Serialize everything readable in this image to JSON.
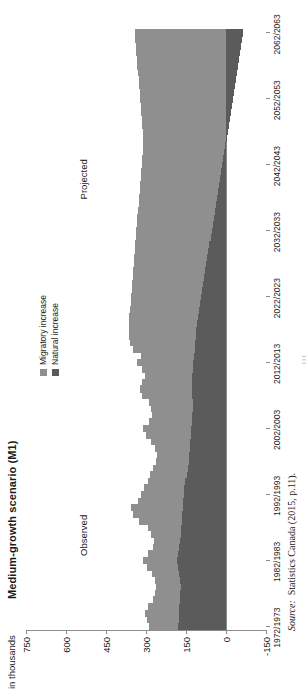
{
  "figure": {
    "title": "Medium-growth scenario (M1)",
    "axis_unit": "in thousands",
    "source_label": "Source:",
    "source_text": "Statistics Canada (2015, p.11).",
    "page_marker": "111"
  },
  "legend": {
    "position": "top-center-right",
    "items": [
      {
        "label": "Migratory increase",
        "color": "#8f8f8f",
        "key": "migratory"
      },
      {
        "label": "Natural increase",
        "color": "#5b5b5b",
        "key": "natural"
      }
    ]
  },
  "annotations": [
    {
      "name": "observed-label",
      "text": "Observed",
      "at_category": "1986/1987"
    },
    {
      "name": "projected-label",
      "text": "Projected",
      "at_category": "2040/2041"
    }
  ],
  "chart_data": {
    "type": "bar",
    "stacked": true,
    "orientation": "vertical",
    "title": "Medium-growth scenario (M1)",
    "xlabel": "",
    "ylabel": "in thousands",
    "ylim": [
      -150,
      750
    ],
    "yticks": [
      750,
      600,
      450,
      300,
      150,
      0,
      -150
    ],
    "ytick_labels": [
      "750",
      "600",
      "450",
      "300",
      "150",
      "0",
      "-150"
    ],
    "grid": false,
    "legend_position": "upper right",
    "xtick_labels": [
      "1972/1973",
      "1982/1983",
      "1992/1993",
      "2002/2003",
      "2012/2013",
      "2022/2023",
      "2032/2033",
      "2042/2043",
      "2052/2053",
      "2062/2063"
    ],
    "categories": [
      "1972/1973",
      "1973/1974",
      "1974/1975",
      "1975/1976",
      "1976/1977",
      "1977/1978",
      "1978/1979",
      "1979/1980",
      "1980/1981",
      "1981/1982",
      "1982/1983",
      "1983/1984",
      "1984/1985",
      "1985/1986",
      "1986/1987",
      "1987/1988",
      "1988/1989",
      "1989/1990",
      "1990/1991",
      "1991/1992",
      "1992/1993",
      "1993/1994",
      "1994/1995",
      "1995/1996",
      "1996/1997",
      "1997/1998",
      "1998/1999",
      "1999/2000",
      "2000/2001",
      "2001/2002",
      "2002/2003",
      "2003/2004",
      "2004/2005",
      "2005/2006",
      "2006/2007",
      "2007/2008",
      "2008/2009",
      "2009/2010",
      "2010/2011",
      "2011/2012",
      "2012/2013",
      "2013/2014",
      "2014/2015",
      "2015/2016",
      "2016/2017",
      "2017/2018",
      "2018/2019",
      "2019/2020",
      "2020/2021",
      "2021/2022",
      "2022/2023",
      "2023/2024",
      "2024/2025",
      "2025/2026",
      "2026/2027",
      "2027/2028",
      "2028/2029",
      "2029/2030",
      "2030/2031",
      "2031/2032",
      "2032/2033",
      "2033/2034",
      "2034/2035",
      "2035/2036",
      "2036/2037",
      "2037/2038",
      "2038/2039",
      "2039/2040",
      "2040/2041",
      "2041/2042",
      "2042/2043",
      "2043/2044",
      "2044/2045",
      "2045/2046",
      "2046/2047",
      "2047/2048",
      "2048/2049",
      "2049/2050",
      "2050/2051",
      "2051/2052",
      "2052/2053",
      "2053/2054",
      "2054/2055",
      "2055/2056",
      "2056/2057",
      "2057/2058",
      "2058/2059",
      "2059/2060",
      "2060/2061",
      "2061/2062",
      "2062/2063"
    ],
    "series": [
      {
        "name": "Natural increase",
        "key": "natural",
        "color": "#5b5b5b",
        "values": [
          180,
          178,
          176,
          175,
          174,
          172,
          170,
          172,
          176,
          180,
          182,
          180,
          176,
          172,
          170,
          168,
          166,
          164,
          162,
          160,
          158,
          156,
          152,
          148,
          144,
          140,
          138,
          136,
          134,
          132,
          130,
          128,
          126,
          124,
          124,
          126,
          128,
          128,
          126,
          124,
          122,
          120,
          118,
          116,
          114,
          112,
          110,
          106,
          102,
          98,
          94,
          90,
          86,
          82,
          78,
          74,
          70,
          66,
          62,
          58,
          54,
          50,
          46,
          42,
          38,
          34,
          30,
          26,
          22,
          18,
          14,
          10,
          6,
          2,
          -2,
          -6,
          -10,
          -14,
          -18,
          -22,
          -26,
          -30,
          -34,
          -38,
          -42,
          -46,
          -50,
          -54,
          -58,
          -60,
          -62
        ]
      },
      {
        "name": "Migratory increase",
        "key": "migratory",
        "color": "#8f8f8f",
        "values": [
          110,
          118,
          126,
          116,
          100,
          96,
          92,
          96,
          102,
          118,
          130,
          112,
          96,
          98,
          110,
          126,
          160,
          186,
          196,
          170,
          160,
          152,
          142,
          136,
          130,
          124,
          122,
          130,
          148,
          168,
          180,
          162,
          152,
          158,
          166,
          188,
          196,
          186,
          176,
          190,
          212,
          198,
          230,
          244,
          250,
          252,
          254,
          256,
          258,
          260,
          262,
          264,
          266,
          268,
          270,
          272,
          274,
          276,
          278,
          280,
          282,
          284,
          286,
          288,
          290,
          292,
          294,
          296,
          298,
          300,
          302,
          304,
          306,
          308,
          310,
          312,
          314,
          316,
          318,
          320,
          322,
          324,
          326,
          328,
          330,
          332,
          334,
          336,
          338,
          340,
          342
        ]
      }
    ],
    "projection_starts_at": "2014/2015",
    "observed_period": {
      "label": "Observed",
      "from": "1972/1973",
      "to": "2013/2014"
    },
    "projected_period": {
      "label": "Projected",
      "from": "2014/2015",
      "to": "2062/2063"
    }
  }
}
